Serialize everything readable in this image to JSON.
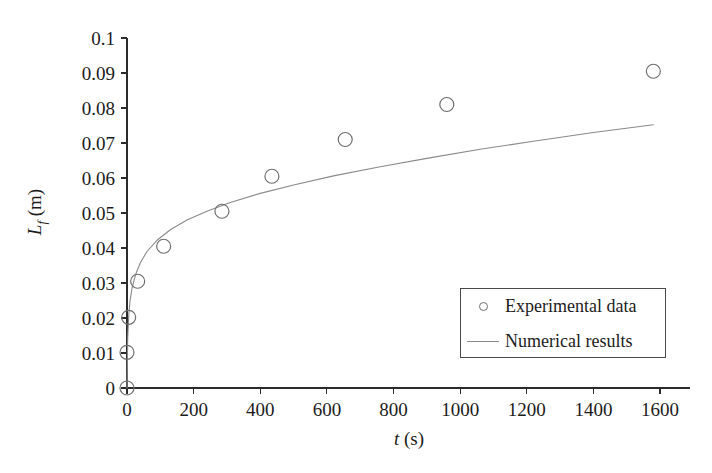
{
  "chart_data": {
    "type": "scatter",
    "title": "",
    "xlabel": "t (s)",
    "ylabel": "L_f (m)",
    "xlim": [
      0,
      1690
    ],
    "ylim": [
      0,
      0.1
    ],
    "grid": false,
    "legend_position": "lower-right",
    "x_ticks": [
      0,
      200,
      400,
      600,
      800,
      1000,
      1200,
      1400,
      1600
    ],
    "x_tick_labels": [
      "0",
      "200",
      "400",
      "600",
      "800",
      "1000",
      "1200",
      "1400",
      "1600"
    ],
    "y_ticks": [
      0,
      0.01,
      0.02,
      0.03,
      0.04,
      0.05,
      0.06,
      0.07,
      0.08,
      0.09,
      0.1
    ],
    "y_tick_labels": [
      "0",
      "0.01",
      "0.02",
      "0.03",
      "0.04",
      "0.05",
      "0.06",
      "0.07",
      "0.08",
      "0.09",
      "0.1"
    ],
    "series": [
      {
        "name": "Experimental data",
        "type": "scatter",
        "marker": "open-circle",
        "color": "#6e6e6e",
        "points": [
          {
            "x": 0,
            "y": 0.0
          },
          {
            "x": 0,
            "y": 0.0102
          },
          {
            "x": 5,
            "y": 0.0202
          },
          {
            "x": 32,
            "y": 0.0305
          },
          {
            "x": 110,
            "y": 0.0405
          },
          {
            "x": 285,
            "y": 0.0505
          },
          {
            "x": 435,
            "y": 0.0605
          },
          {
            "x": 655,
            "y": 0.071
          },
          {
            "x": 960,
            "y": 0.081
          },
          {
            "x": 1580,
            "y": 0.0905
          }
        ]
      },
      {
        "name": "Numerical results",
        "type": "line",
        "color": "#8a8a8a",
        "points": [
          {
            "x": 0,
            "y": 0.0
          },
          {
            "x": 2,
            "y": 0.014
          },
          {
            "x": 5,
            "y": 0.0205
          },
          {
            "x": 9,
            "y": 0.0248
          },
          {
            "x": 15,
            "y": 0.0285
          },
          {
            "x": 25,
            "y": 0.0322
          },
          {
            "x": 40,
            "y": 0.0358
          },
          {
            "x": 60,
            "y": 0.039
          },
          {
            "x": 90,
            "y": 0.0422
          },
          {
            "x": 130,
            "y": 0.0452
          },
          {
            "x": 180,
            "y": 0.048
          },
          {
            "x": 240,
            "y": 0.0505
          },
          {
            "x": 310,
            "y": 0.053
          },
          {
            "x": 400,
            "y": 0.0556
          },
          {
            "x": 500,
            "y": 0.058
          },
          {
            "x": 620,
            "y": 0.0606
          },
          {
            "x": 760,
            "y": 0.0632
          },
          {
            "x": 900,
            "y": 0.0656
          },
          {
            "x": 1060,
            "y": 0.0682
          },
          {
            "x": 1220,
            "y": 0.0705
          },
          {
            "x": 1400,
            "y": 0.073
          },
          {
            "x": 1580,
            "y": 0.0752
          }
        ]
      }
    ]
  },
  "axes": {
    "x_axis_title_variable": "t",
    "x_axis_title_unit": " (s)",
    "y_axis_title_variable": "L",
    "y_axis_title_subscript": "f",
    "y_axis_title_unit": " (m)"
  },
  "legend": {
    "entries": [
      {
        "label": "Experimental data",
        "key": "open-circle"
      },
      {
        "label": "Numerical results",
        "key": "line"
      }
    ]
  },
  "colors": {
    "axis": "#2b2b2b",
    "marker": "#6e6e6e",
    "curve": "#8a8a8a",
    "text": "#1c1c1c",
    "background": "#ffffff",
    "legend_border": "#4a4a4a"
  }
}
